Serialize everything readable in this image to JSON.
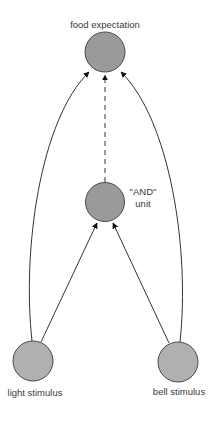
{
  "diagram": {
    "colors": {
      "node_fill": "#9a9a9a",
      "node_stroke": "#4a4a4a",
      "edge": "#333333",
      "text": "#3a3a3a"
    },
    "nodes": [
      {
        "id": "food",
        "label": "food expectation"
      },
      {
        "id": "and",
        "label_line1": "\"AND\"",
        "label_line2": "unit"
      },
      {
        "id": "light",
        "label": "light stimulus"
      },
      {
        "id": "bell",
        "label": "bell stimulus"
      }
    ],
    "edges": [
      {
        "from": "light",
        "to": "food",
        "style": "solid"
      },
      {
        "from": "bell",
        "to": "food",
        "style": "solid"
      },
      {
        "from": "light",
        "to": "and",
        "style": "solid"
      },
      {
        "from": "bell",
        "to": "and",
        "style": "solid"
      },
      {
        "from": "and",
        "to": "food",
        "style": "dashed"
      }
    ]
  }
}
